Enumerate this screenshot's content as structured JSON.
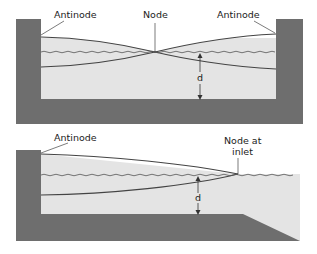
{
  "colors": {
    "basin": "#6e6e6e",
    "water": "#e4e4e4",
    "outline": "#444444",
    "label": "#222222"
  },
  "top_diagram": {
    "label_antinode_left": "Antinode",
    "label_node": "Node",
    "label_antinode_right": "Antinode",
    "label_depth": "d"
  },
  "bottom_diagram": {
    "label_antinode": "Antinode",
    "label_node_line1": "Node at",
    "label_node_line2": "inlet",
    "label_depth": "d"
  }
}
